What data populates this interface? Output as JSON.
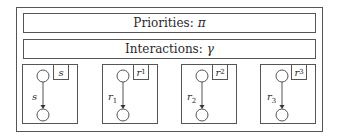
{
  "bands": {
    "priorities": {
      "label": "Priorities:",
      "symbol": "π"
    },
    "interactions": {
      "label": "Interactions:",
      "symbol": "γ"
    }
  },
  "components": [
    {
      "tag": "s",
      "tag_sub": "",
      "edge_label": "s",
      "edge_sub": ""
    },
    {
      "tag": "r",
      "tag_sub": "1",
      "edge_label": "r",
      "edge_sub": "1"
    },
    {
      "tag": "r",
      "tag_sub": "2",
      "edge_label": "r",
      "edge_sub": "2"
    },
    {
      "tag": "r",
      "tag_sub": "3",
      "edge_label": "r",
      "edge_sub": "3"
    }
  ],
  "colors": {
    "stroke": "#555555",
    "text": "#2a2a2a",
    "background": "#ffffff"
  }
}
